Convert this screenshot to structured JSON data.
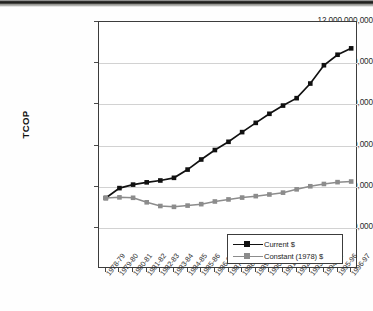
{
  "chart_data": {
    "type": "line",
    "title": "",
    "xlabel": "",
    "ylabel": "TCOP",
    "ylim": [
      0,
      12000000000
    ],
    "grid": true,
    "legend_position": "bottom-right",
    "categories": [
      "1978-79",
      "1979-80",
      "1980-81",
      "1981-82",
      "1982-83",
      "1983-84",
      "1984-85",
      "1985-86",
      "1986-87",
      "1987-88",
      "1988-89",
      "1989-90",
      "1990-91",
      "1991-92",
      "1992-93",
      "1993-94",
      "1994-95",
      "1995-96",
      "1996-97"
    ],
    "yticks": [
      {
        "value": 2000000000,
        "label": "2,000,000,000"
      },
      {
        "value": 4000000000,
        "label": "4,000,000,000"
      },
      {
        "value": 6000000000,
        "label": "6,000,000,000"
      },
      {
        "value": 8000000000,
        "label": "8,000,000,000"
      },
      {
        "value": 10000000000,
        "label": "10,000,000,000"
      },
      {
        "value": 12000000000,
        "label": "12,000,000,000"
      }
    ],
    "series": [
      {
        "name": "Current $",
        "color": "#111111",
        "marker": "square",
        "values": [
          3450000000,
          3930000000,
          4100000000,
          4210000000,
          4300000000,
          4430000000,
          4830000000,
          5320000000,
          5780000000,
          6180000000,
          6650000000,
          7100000000,
          7540000000,
          7940000000,
          8300000000,
          9010000000,
          9900000000,
          10410000000,
          10720000000
        ]
      },
      {
        "name": "Constant (1978) $",
        "color": "#8c8c8c",
        "marker": "square",
        "values": [
          3450000000,
          3480000000,
          3460000000,
          3240000000,
          3060000000,
          3020000000,
          3080000000,
          3150000000,
          3280000000,
          3380000000,
          3470000000,
          3540000000,
          3620000000,
          3710000000,
          3870000000,
          4020000000,
          4130000000,
          4220000000,
          4250000000
        ]
      }
    ]
  },
  "legend": {
    "entries": [
      {
        "label": "Current $"
      },
      {
        "label": "Constant (1978) $"
      }
    ]
  }
}
